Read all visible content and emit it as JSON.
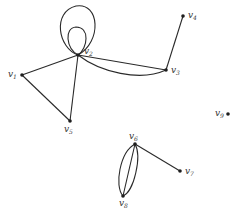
{
  "diagram": {
    "type": "graph",
    "vertices": [
      {
        "id": "v1",
        "label": "v",
        "sub": "1",
        "x": 22,
        "y": 75
      },
      {
        "id": "v2",
        "label": "v",
        "sub": "2",
        "x": 78,
        "y": 55
      },
      {
        "id": "v3",
        "label": "v",
        "sub": "3",
        "x": 166,
        "y": 70
      },
      {
        "id": "v4",
        "label": "v",
        "sub": "4",
        "x": 183,
        "y": 16
      },
      {
        "id": "v5",
        "label": "v",
        "sub": "5",
        "x": 70,
        "y": 121
      },
      {
        "id": "v6",
        "label": "v",
        "sub": "6",
        "x": 135,
        "y": 144
      },
      {
        "id": "v7",
        "label": "v",
        "sub": "7",
        "x": 180,
        "y": 171
      },
      {
        "id": "v8",
        "label": "v",
        "sub": "8",
        "x": 123,
        "y": 196
      },
      {
        "id": "v9",
        "label": "v",
        "sub": "9",
        "x": 228,
        "y": 114
      }
    ],
    "edges": [
      {
        "from": "v2",
        "to": "v2",
        "kind": "loop-large"
      },
      {
        "from": "v2",
        "to": "v2",
        "kind": "loop-small"
      },
      {
        "from": "v1",
        "to": "v2",
        "kind": "straight"
      },
      {
        "from": "v1",
        "to": "v5",
        "kind": "straight"
      },
      {
        "from": "v2",
        "to": "v5",
        "kind": "straight"
      },
      {
        "from": "v2",
        "to": "v3",
        "kind": "straight"
      },
      {
        "from": "v2",
        "to": "v3",
        "kind": "curved"
      },
      {
        "from": "v3",
        "to": "v4",
        "kind": "straight"
      },
      {
        "from": "v6",
        "to": "v7",
        "kind": "straight"
      },
      {
        "from": "v6",
        "to": "v8",
        "kind": "straight"
      },
      {
        "from": "v6",
        "to": "v8",
        "kind": "curved-left"
      },
      {
        "from": "v6",
        "to": "v8",
        "kind": "curved-right"
      }
    ]
  }
}
